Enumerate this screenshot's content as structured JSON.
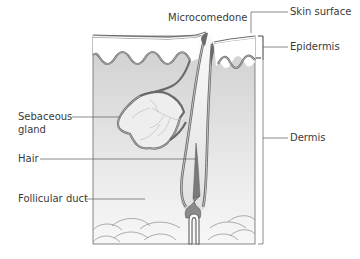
{
  "diagram": {
    "labels": {
      "microcomedone": "Microcomedone",
      "skin_surface": "Skin surface",
      "epidermis": "Epidermis",
      "dermis": "Dermis",
      "sebaceous_gland_line1": "Sebaceous",
      "sebaceous_gland_line2": "gland",
      "hair": "Hair",
      "follicular_duct": "Follicular duct"
    },
    "colors": {
      "dermis_fill": "#d6d6d6",
      "dermis_fill_light": "#f0f0f0",
      "outline": "#5a5a5a",
      "membrane": "#8a8a8a",
      "hair_fill": "#7a7a7a",
      "text": "#3a3a3a"
    }
  }
}
